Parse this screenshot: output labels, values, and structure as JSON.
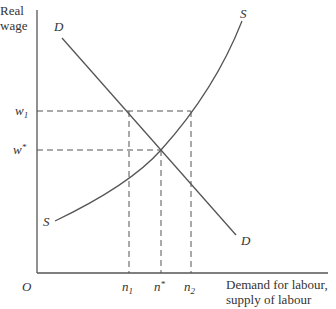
{
  "diagram": {
    "y_axis_label_line1": "Real",
    "y_axis_label_line2": "wage",
    "x_axis_label_line1": "Demand for labour,",
    "x_axis_label_line2": "supply of labour",
    "origin_label": "O",
    "demand_label": "D",
    "supply_label": "S",
    "wage_levels": [
      {
        "label": "w",
        "sub": "1",
        "sup": ""
      },
      {
        "label": "w",
        "sub": "",
        "sup": "*"
      }
    ],
    "quantity_levels": [
      {
        "label": "n",
        "sub": "1",
        "sup": ""
      },
      {
        "label": "n",
        "sub": "",
        "sup": "*"
      },
      {
        "label": "n",
        "sub": "2",
        "sup": ""
      }
    ],
    "line_color": "#555555"
  }
}
